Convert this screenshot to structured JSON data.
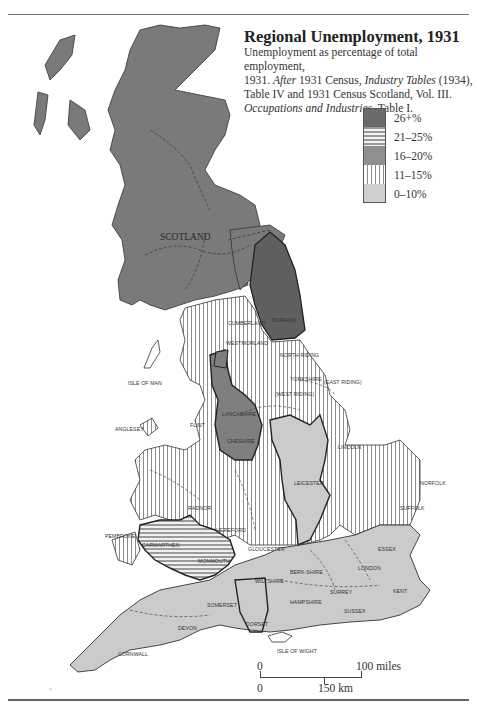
{
  "title": "Regional Unemployment, 1931",
  "subtitle": {
    "line1": "Unemployment as percentage of total employment,",
    "line2_a": "1931. ",
    "line2_b": "After",
    "line2_c": " 1931 Census, ",
    "line2_d": "Industry Tables",
    "line2_e": " (1934),",
    "line3": "Table IV and 1931 Census Scotland, Vol. III.",
    "line4_a": "Occupations and Industries",
    "line4_b": ". Table I."
  },
  "legend": [
    {
      "label": "26+%",
      "pattern": "dark-solid",
      "color": "#6b6b6b"
    },
    {
      "label": "21–25%",
      "pattern": "horizontal-stripes",
      "color": "#9a9a9a"
    },
    {
      "label": "16–20%",
      "pattern": "medium-solid",
      "color": "#8f8f8f"
    },
    {
      "label": "11–15%",
      "pattern": "vertical-stripes",
      "color": "#8c8c8c"
    },
    {
      "label": "0–10%",
      "pattern": "light-stipple",
      "color": "#cfcfcf"
    }
  ],
  "regions": {
    "scotland": {
      "label": "SCOTLAND",
      "category": "16–20%"
    },
    "northeast": {
      "label": "DURHAM",
      "category": "26+%"
    },
    "northwest_lakes": {
      "labels": [
        "CUMBERLAND",
        "WESTMORLAND"
      ],
      "category": "11–15%"
    },
    "yorkshire": {
      "labels": [
        "NORTH RIDING",
        "YORKSHIRE",
        "EAST RIDING",
        "WEST RIDING"
      ],
      "category": "11–15%"
    },
    "lancashire": {
      "labels": [
        "LANCASHIRE",
        "CHESHIRE"
      ],
      "category": "16–20%"
    },
    "north_wales": {
      "labels": [
        "ANGLESEY",
        "FLINT",
        "CAERNARVON",
        "DENBIGH",
        "MERIONETH",
        "MONTGOMERY",
        "CARDIGAN",
        "RADNOR"
      ],
      "category": "11–15%"
    },
    "south_wales": {
      "labels": [
        "CARMARTHEN",
        "GLAMORGAN",
        "MONMOUTH",
        "BRECKNOCK"
      ],
      "category": "21–25%"
    },
    "pembroke": {
      "label": "PEMBROKE",
      "category": "11–15%"
    },
    "midlands_west": {
      "labels": [
        "SHROPSHIRE",
        "STAFFORD",
        "WORCESTER",
        "WARWICK",
        "HEREFORD",
        "GLOUCESTER"
      ],
      "category": "11–15%"
    },
    "midlands_east": {
      "labels": [
        "DERBYSHIRE",
        "NOTTINGHAM",
        "LEICESTER",
        "NORTHAMPTON"
      ],
      "category": "0–10%"
    },
    "lincoln_east": {
      "labels": [
        "LINCOLN",
        "NORFOLK",
        "SUFFOLK",
        "CAMBRIDGE",
        "HUNTINGDON"
      ],
      "category": "11–15%"
    },
    "south_east": {
      "labels": [
        "OXFORD",
        "BUCKINGHAM",
        "BEDFORD",
        "HERTFORD",
        "ESSEX",
        "BERKSHIRE",
        "LONDON",
        "SURREY",
        "KENT",
        "SUSSEX",
        "HAMPSHIRE"
      ],
      "category": "0–10%"
    },
    "south_west": {
      "labels": [
        "WILTSHIRE",
        "SOMERSET",
        "DORSET",
        "DEVON",
        "CORNWALL"
      ],
      "category": "0–10%"
    }
  },
  "place_labels": {
    "isle_of_man": "ISLE OF MAN",
    "isle_of_wight": "ISLE OF WIGHT",
    "scotland": "SCOTLAND",
    "durham": "DURHAM",
    "cumberland": "CUMBERLAND",
    "westmorland": "WESTMORLAND",
    "north_riding": "NORTH RIDING",
    "yorkshire": "YORKSHIRE",
    "east_riding": "(EAST RIDING)",
    "west_riding": "(WEST RIDING)",
    "lancashire": "LANCASHIRE",
    "cheshire": "CHESHIRE",
    "anglesey": "ANGLESEY",
    "flint": "FLINT",
    "lincoln": "LINCOLN",
    "norfolk": "NORFOLK",
    "suffolk": "SUFFOLK",
    "leicester": "LEICESTER",
    "derbyshire": "DERBYSHIRE",
    "nottingham": "NOTTINGHAM",
    "northampton": "NORTHAMPTON",
    "shropshire": "SHROPSHIRE",
    "stafford": "STAFFORD",
    "worcester": "WORCESTER",
    "warwick": "WARWICK",
    "hereford": "HEREFORD",
    "radnor": "RADNOR",
    "pembroke": "PEMBROKE",
    "carmarthen": "CARMARTHEN",
    "monmouth": "MONMOUTH",
    "gloucester": "GLOUCESTER",
    "wiltshire": "WILTSHIRE",
    "oxford": "OXFORD",
    "berkshire": "BERK-SHIRE",
    "essex": "ESSEX",
    "london": "LONDON",
    "surrey": "SURREY",
    "kent": "KENT",
    "sussex": "SUSSEX",
    "hampshire": "HAMPSHIRE",
    "somerset": "SOMERSET",
    "dorset": "DORSET",
    "devon": "DEVON",
    "cornwall": "CORNWALL"
  },
  "scale_bar": {
    "top_left": "0",
    "top_right": "100 miles",
    "bottom_left": "0",
    "bottom_right": "150 km"
  }
}
